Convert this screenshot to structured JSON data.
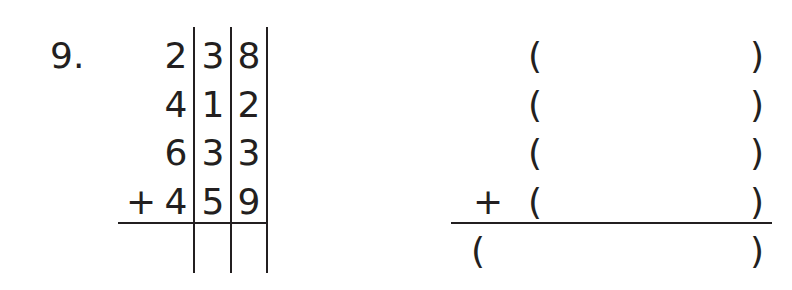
{
  "problem": {
    "number_label": "9.",
    "operator": "+",
    "rows": [
      {
        "hundreds": "2",
        "tens": "3",
        "ones": "8",
        "operator": ""
      },
      {
        "hundreds": "4",
        "tens": "1",
        "ones": "2",
        "operator": ""
      },
      {
        "hundreds": "6",
        "tens": "3",
        "ones": "3",
        "operator": ""
      },
      {
        "hundreds": "4",
        "tens": "5",
        "ones": "9",
        "operator": "+"
      }
    ],
    "answer": {
      "hundreds": "",
      "tens": "",
      "ones": ""
    }
  },
  "right_block": {
    "open_paren": "(",
    "close_paren": ")",
    "operator": "+",
    "rows": [
      {
        "value": ""
      },
      {
        "value": ""
      },
      {
        "value": ""
      },
      {
        "value": ""
      }
    ],
    "sum": {
      "value": ""
    }
  },
  "colors": {
    "ink": "#231f20",
    "background": "#ffffff"
  }
}
